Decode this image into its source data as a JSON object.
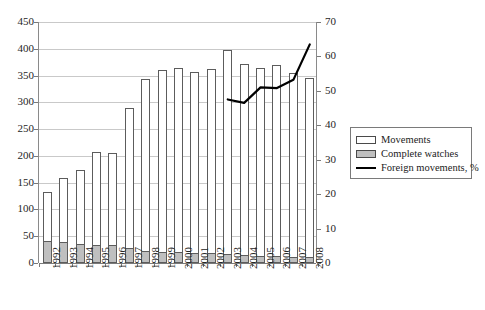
{
  "chart_data": {
    "type": "bar",
    "title": "",
    "subtitle": "",
    "xlabel": "",
    "ylabel": "",
    "y2label": "",
    "grid": true,
    "legend_position": "right",
    "categories": [
      "1992",
      "1993",
      "1994",
      "1995",
      "1996",
      "1997",
      "1998",
      "1999",
      "2000",
      "2001",
      "2002",
      "2003",
      "2004",
      "2005",
      "2006",
      "2007",
      "2008"
    ],
    "ylim": [
      0,
      450
    ],
    "yticks": [
      0,
      50,
      100,
      150,
      200,
      250,
      300,
      350,
      400,
      450
    ],
    "y2lim": [
      0,
      70
    ],
    "y2ticks": [
      0,
      10,
      20,
      30,
      40,
      50,
      60,
      70
    ],
    "series": [
      {
        "name": "Movements",
        "type": "bar",
        "axis": "left",
        "color": "#ffffff",
        "edge_color": "#5c5c5c",
        "values": [
          132,
          158,
          174,
          208,
          205,
          290,
          344,
          361,
          365,
          356,
          362,
          397,
          372,
          365,
          369,
          354,
          346
        ]
      },
      {
        "name": "Complete watches",
        "type": "bar",
        "axis": "left",
        "color": "#bfbfbf",
        "edge_color": "#5c5c5c",
        "values": [
          42,
          40,
          36,
          33,
          33,
          28,
          22,
          20,
          20,
          19,
          18,
          16,
          15,
          14,
          13,
          12,
          12
        ]
      },
      {
        "name": "Foreign movements, %",
        "type": "line",
        "axis": "right",
        "color": "#000000",
        "x": [
          "2003",
          "2004",
          "2005",
          "2006",
          "2007",
          "2008"
        ],
        "values": [
          47.5,
          46.5,
          51.0,
          50.8,
          53.2,
          63.5
        ]
      }
    ]
  },
  "legend": {
    "items": [
      {
        "label": "Movements",
        "swatch": "open-square-swatch"
      },
      {
        "label": "Complete watches",
        "swatch": "gray-square-swatch"
      },
      {
        "label": "Foreign movements, %",
        "swatch": "black-line-swatch"
      }
    ]
  }
}
